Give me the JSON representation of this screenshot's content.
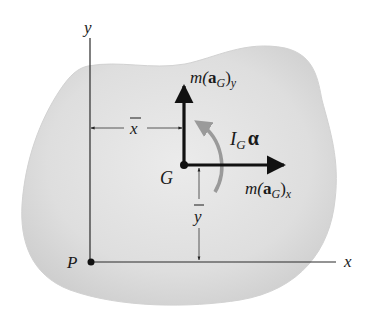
{
  "figure": {
    "type": "free-body / kinetic diagram of rigid body",
    "colors": {
      "body_fill": "#e2e2e2",
      "body_edge": "#d0d0d0",
      "axis": "#2a2a2a",
      "vector": "#111111",
      "moment_arrow": "#9a9a9a",
      "text": "#1a1a1a"
    },
    "axes": {
      "x_label": "x",
      "y_label": "y",
      "origin_label": "P"
    },
    "points": {
      "center_of_mass": "G",
      "origin": "P"
    },
    "dimensions": {
      "horizontal": "x",
      "vertical": "y"
    },
    "vectors": {
      "vertical": {
        "prefix": "m(",
        "bold": "a",
        "sub": "G",
        "suffix": ")",
        "component": "y"
      },
      "horizontal": {
        "prefix": "m(",
        "bold": "a",
        "sub": "G",
        "suffix": ")",
        "component": "x"
      }
    },
    "moment": {
      "symbol": "I",
      "sub": "G",
      "greek": "α"
    }
  }
}
